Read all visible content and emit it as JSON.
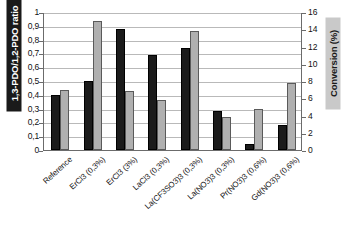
{
  "chart_data": {
    "type": "bar",
    "title": "",
    "subtitle": "",
    "xlabel": "",
    "categories": [
      "Reference",
      "ErCl3 (0,3%)",
      "ErCl3 (3%)",
      "LaCl3 (0,3%)",
      "La(CF3SO3)3 (0,3%)",
      "La(NO3)3 (0,3%)",
      "Pr(NO3)3 (0,6%)",
      "Gd(NO3)3 (0,6%)"
    ],
    "series": [
      {
        "name": "1,3-PDO/1,2-PDO ratio",
        "axis": "left",
        "color": "#1b1b1b",
        "values": [
          0.4,
          0.5,
          0.875,
          0.69,
          0.74,
          0.285,
          0.04,
          0.18
        ]
      },
      {
        "name": "Conversion (%)",
        "axis": "right",
        "color": "#b0b0b0",
        "values": [
          7.0,
          15.0,
          6.85,
          5.75,
          13.8,
          3.85,
          4.75,
          7.8
        ]
      }
    ],
    "left_axis": {
      "label": "1,3-PDO/1,2-PDO ratio",
      "ylim": [
        0,
        1
      ],
      "ticks": [
        "0",
        "0,1",
        "0,2",
        "0,3",
        "0,4",
        "0,5",
        "0,6",
        "0,7",
        "0,8",
        "0,9",
        "1"
      ],
      "tick_values": [
        0,
        0.1,
        0.2,
        0.3,
        0.4,
        0.5,
        0.6,
        0.7,
        0.8,
        0.9,
        1.0
      ],
      "label_bg_color": "#1a1a1a",
      "label_text_color": "#ffffff"
    },
    "right_axis": {
      "label": "Conversion (%)",
      "ylim": [
        0,
        16
      ],
      "ticks": [
        "0",
        "2",
        "4",
        "6",
        "8",
        "10",
        "12",
        "14",
        "16"
      ],
      "tick_values": [
        0,
        2,
        4,
        6,
        8,
        10,
        12,
        14,
        16
      ],
      "label_bg_color": "#c9c9c9",
      "label_text_color": "#1a1a1a"
    },
    "grid": true,
    "legend": "none"
  }
}
